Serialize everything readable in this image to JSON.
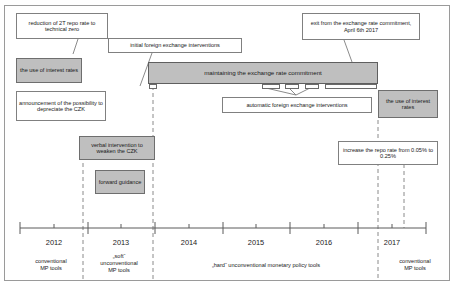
{
  "callouts": {
    "repo_zero": "reduction of 2T repo rate to technical zero",
    "initial_fx": "initial foreign exchange interventions",
    "exit_commitment": "exit from the exchange rate commitment, April 6th 2017",
    "announcement_czk": "announcement of the possibility to depreciate the CZK",
    "automatic_fx": "automatic foreign exchange interventions",
    "increase_repo": "increase the repo rate from 0.05% to 0.25%"
  },
  "bands": {
    "interest_rates_left": "the use of interest rates",
    "interest_rates_right": "the use of interest rates",
    "commitment": "maintaining the exchange rate commitment",
    "verbal_intervention": "verbal intervention to weaken the CZK",
    "forward_guidance": "forward guidance"
  },
  "axis": {
    "years": [
      {
        "label": "2012",
        "x": 54
      },
      {
        "label": "2013",
        "x": 121
      },
      {
        "label": "2014",
        "x": 189
      },
      {
        "label": "2015",
        "x": 256
      },
      {
        "label": "2016",
        "x": 324
      },
      {
        "label": "2017",
        "x": 392
      }
    ],
    "major_ticks": [
      20,
      88,
      155,
      223,
      290,
      358,
      426
    ],
    "minor_ticks": [
      54,
      121,
      189,
      256,
      324,
      392
    ],
    "dividers": [
      83,
      153,
      378,
      404
    ]
  },
  "categories": [
    {
      "label": "conventional\nMP tools",
      "lines": [
        "conventional",
        "MP tools"
      ],
      "x": 51,
      "width": 66
    },
    {
      "label": "„soft“ unconventional MP tools",
      "lines": [
        "„soft“",
        "unconventional",
        "MP tools"
      ],
      "x": 118,
      "width": 70
    },
    {
      "label": "„hard“ unconventional monetary policy tools",
      "lines": [
        "„hard“ unconventional monetary policy tools"
      ],
      "x": 265,
      "width": 224
    },
    {
      "label": "conventional MP tools",
      "lines": [
        "conventional",
        "MP tools"
      ],
      "x": 416,
      "width": 70
    }
  ],
  "colors": {
    "gray_fill": "#bfbfbf",
    "box_border": "#808080",
    "frame_border": "#9a9a9a",
    "text": "#1a1a1a"
  }
}
